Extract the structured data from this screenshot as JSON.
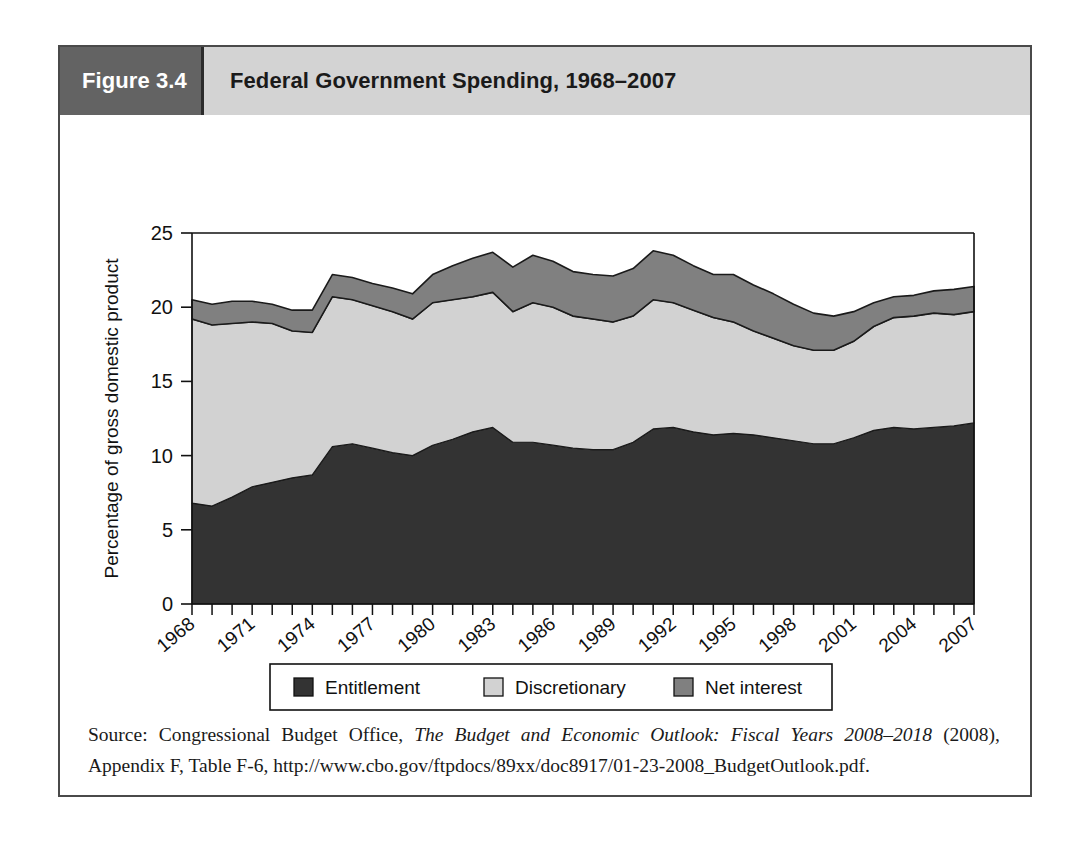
{
  "figure": {
    "number_label": "Figure 3.4",
    "title": "Federal Government Spending, 1968–2007"
  },
  "source": {
    "prefix": "Source: Congressional Budget Office, ",
    "italic_title": "The Budget and Economic Outlook: Fiscal Years 2008–2018",
    "suffix": " (2008), Appendix F, Table F-6, http://www.cbo.gov/ftpdocs/89xx/doc8917/01-23-2008_BudgetOutlook.pdf."
  },
  "colors": {
    "entitlement": "#333333",
    "discretionary": "#d2d2d2",
    "net_interest": "#808080",
    "outline": "#1a1a1a",
    "header_number_bg": "#636363",
    "header_title_bg": "#d3d3d3",
    "frame_border": "#4a4a4a"
  },
  "legend": {
    "items": [
      {
        "label": "Entitlement",
        "color_key": "entitlement"
      },
      {
        "label": "Discretionary",
        "color_key": "discretionary"
      },
      {
        "label": "Net interest",
        "color_key": "net_interest"
      }
    ]
  },
  "chart_data": {
    "type": "area",
    "stacked": true,
    "title": "Federal Government Spending, 1968–2007",
    "xlabel": "",
    "ylabel": "Percentage of gross domestic product",
    "ylim": [
      0,
      25
    ],
    "yticks": [
      0,
      5,
      10,
      15,
      20,
      25
    ],
    "ytick_labels": [
      "0",
      "5",
      "10",
      "15",
      "20",
      "25"
    ],
    "grid": false,
    "legend_position": "bottom",
    "x": [
      1968,
      1969,
      1970,
      1971,
      1972,
      1973,
      1974,
      1975,
      1976,
      1977,
      1978,
      1979,
      1980,
      1981,
      1982,
      1983,
      1984,
      1985,
      1986,
      1987,
      1988,
      1989,
      1990,
      1991,
      1992,
      1993,
      1994,
      1995,
      1996,
      1997,
      1998,
      1999,
      2000,
      2001,
      2002,
      2003,
      2004,
      2005,
      2006,
      2007
    ],
    "xtick_labels": [
      "1968",
      "1971",
      "1974",
      "1977",
      "1980",
      "1983",
      "1986",
      "1989",
      "1992",
      "1995",
      "1998",
      "2001",
      "2004",
      "2007"
    ],
    "xtick_step": 3,
    "series": [
      {
        "name": "Entitlement",
        "color_key": "entitlement",
        "values": [
          6.8,
          6.6,
          7.2,
          7.9,
          8.2,
          8.5,
          8.7,
          10.6,
          10.8,
          10.5,
          10.2,
          10.0,
          10.7,
          11.1,
          11.6,
          11.9,
          10.9,
          10.9,
          10.7,
          10.5,
          10.4,
          10.4,
          10.9,
          11.8,
          11.9,
          11.6,
          11.4,
          11.5,
          11.4,
          11.2,
          11.0,
          10.8,
          10.8,
          11.2,
          11.7,
          11.9,
          11.8,
          11.9,
          12.0,
          12.2
        ]
      },
      {
        "name": "Discretionary",
        "color_key": "discretionary",
        "values": [
          12.4,
          12.2,
          11.7,
          11.1,
          10.7,
          9.9,
          9.6,
          10.1,
          9.7,
          9.6,
          9.5,
          9.2,
          9.6,
          9.4,
          9.1,
          9.1,
          8.8,
          9.4,
          9.3,
          8.9,
          8.8,
          8.6,
          8.5,
          8.7,
          8.4,
          8.2,
          7.9,
          7.5,
          7.0,
          6.7,
          6.4,
          6.3,
          6.3,
          6.5,
          7.0,
          7.4,
          7.6,
          7.7,
          7.5,
          7.5
        ]
      },
      {
        "name": "Net interest",
        "color_key": "net_interest",
        "values": [
          1.3,
          1.4,
          1.5,
          1.4,
          1.3,
          1.4,
          1.5,
          1.5,
          1.5,
          1.5,
          1.6,
          1.7,
          1.9,
          2.3,
          2.6,
          2.7,
          3.0,
          3.2,
          3.1,
          3.0,
          3.0,
          3.1,
          3.2,
          3.3,
          3.2,
          3.0,
          2.9,
          3.2,
          3.1,
          3.0,
          2.8,
          2.5,
          2.3,
          2.0,
          1.6,
          1.4,
          1.4,
          1.5,
          1.7,
          1.7
        ]
      }
    ]
  }
}
